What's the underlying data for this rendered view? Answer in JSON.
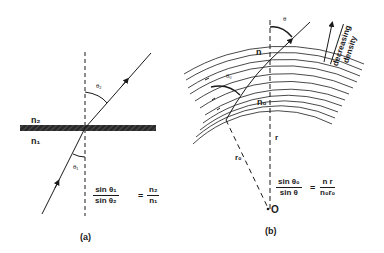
{
  "panel_a": {
    "caption": "(a)",
    "medium_upper": "n₂",
    "medium_lower": "n₁",
    "angle_incident": "θ₁",
    "angle_refracted": "θ₂",
    "formula": {
      "lhs_num": "sin θ₁",
      "lhs_den": "sin θ₂",
      "equals": "=",
      "rhs_num": "n₂",
      "rhs_den": "n₁"
    }
  },
  "panel_b": {
    "caption": "(b)",
    "label_n": "n",
    "label_n0": "n₀",
    "label_r": "r",
    "label_r0": "r₀",
    "label_origin": "O",
    "angle_initial": "θ₀",
    "angle_final": "θ",
    "gradient_label_line1": "decreasing",
    "gradient_label_line2": "density",
    "formula": {
      "lhs_num": "sin θ₀",
      "lhs_den": "sin θ",
      "equals": "=",
      "rhs_num": "n r",
      "rhs_den": "n₀r₀"
    }
  },
  "colors": {
    "ink": "#1a1a1a",
    "background": "#ffffff"
  }
}
